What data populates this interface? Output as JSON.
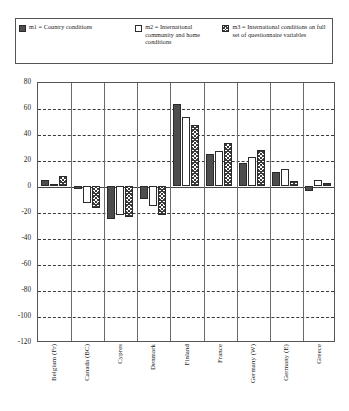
{
  "legend": {
    "entries": [
      {
        "icon": "legend-swatch-solid-dark",
        "text": "m1 = Country conditions"
      },
      {
        "icon": "legend-swatch-white",
        "text": "m2 = International community and home conditions"
      },
      {
        "icon": "legend-swatch-crosshatch",
        "text": "m3 = International conditions on full set of questionnaire variables"
      }
    ]
  },
  "axes": {
    "yticks": [
      "80",
      "60",
      "40",
      "20",
      "0",
      "-20",
      "-40",
      "-60",
      "-80",
      "-100",
      "-120"
    ]
  },
  "chart_data": {
    "type": "bar",
    "title": "",
    "xlabel": "",
    "ylabel": "",
    "ylim": [
      -120,
      80
    ],
    "ytick_step": 20,
    "grid": true,
    "legend_position": "top",
    "categories": [
      "Belgium (Fr)",
      "Canada (BC)",
      "Cypres",
      "Denmark",
      "Finland",
      "France",
      "Germany (W)",
      "Germany (E)",
      "Greece"
    ],
    "series": [
      {
        "name": "m1 = Country conditions",
        "values": [
          5,
          -1,
          -25,
          -10,
          63,
          25,
          18,
          11,
          -4
        ]
      },
      {
        "name": "m2 = International community and home conditions",
        "values": [
          1,
          -13,
          -22,
          -15,
          53,
          27,
          22,
          13,
          5
        ]
      },
      {
        "name": "m3 = International conditions on full set of questionnaire variables",
        "values": [
          8,
          -17,
          -24,
          -22,
          47,
          33,
          28,
          4,
          2
        ]
      }
    ]
  }
}
